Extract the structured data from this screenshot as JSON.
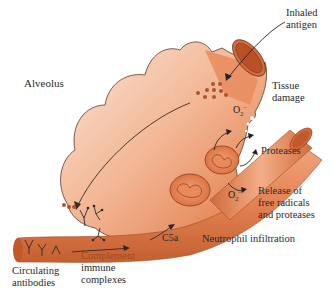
{
  "diagram": {
    "type": "biological-illustration",
    "labels": {
      "alveolus": "Alveolus",
      "inhaled_antigen_1": "Inhaled",
      "inhaled_antigen_2": "antigen",
      "tissue_damage_1": "Tissue",
      "tissue_damage_2": "damage",
      "o2_radical_top": "O",
      "o2_radical_bottom": "O",
      "o2_sub": "2",
      "o2_sup": "−",
      "proteases": "Proteases",
      "release_1": "Release of",
      "release_2": "free radicals",
      "release_3": "and proteases",
      "c5a": "C5a",
      "neutrophil_infiltration": "Neutrophil infiltration",
      "complement": "Complement",
      "immune_complexes_1": "immune",
      "immune_complexes_2": "complexes",
      "circulating_1": "Circulating",
      "circulating_2": "antibodies"
    },
    "colors": {
      "tissue_light": "#f6d3c0",
      "tissue_dark": "#e0743f",
      "vessel": "#e38152",
      "vessel_dark": "#b8532a",
      "outline": "#5a3a2a",
      "complement_text": "#a0481f",
      "text": "#2a2a2a"
    }
  }
}
